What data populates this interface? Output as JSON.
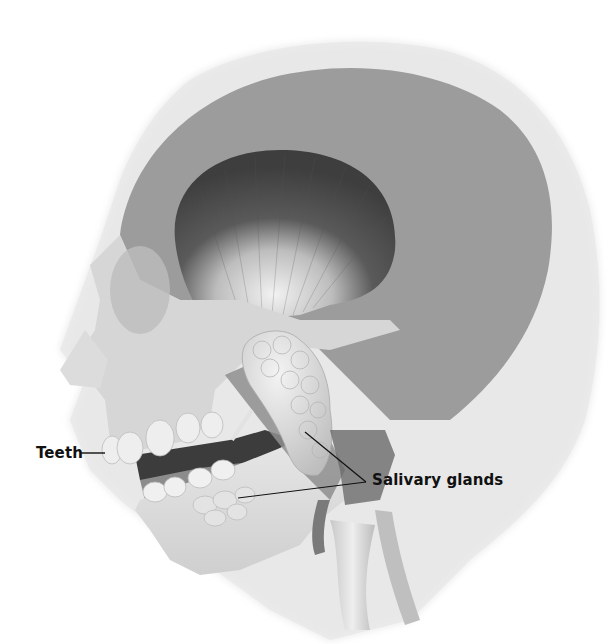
{
  "figure": {
    "style": "grayscale anatomical illustration"
  },
  "labels": {
    "teeth": "Teeth",
    "salivary_glands": "Salivary glands"
  },
  "colors": {
    "background": "#ffffff",
    "head_silhouette": "#e4e4e4",
    "skull": "#9a9a9a",
    "bone_light": "#cfcfcf",
    "muscle_dark": "#4a4a4a",
    "gland": "#d8d8d8",
    "mouth_dark": "#3a3a3a",
    "label_text": "#111111",
    "leader_line": "#111111"
  }
}
